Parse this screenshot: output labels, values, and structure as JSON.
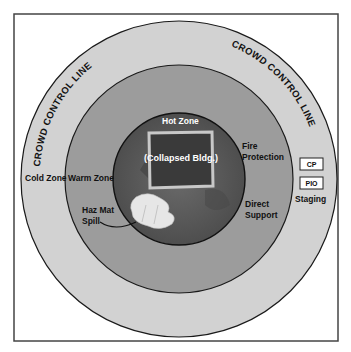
{
  "diagram": {
    "crowd_control_label_left": "CROWD CONTROL LINE",
    "crowd_control_label_right": "CROWD CONTROL LINE",
    "zones": {
      "cold": "Cold Zone",
      "warm": "Warm Zone",
      "hot": "Hot Zone"
    },
    "center_label": "(Collapsed Bldg.)",
    "fire_protection": [
      "Fire",
      "Protection"
    ],
    "direct_support": [
      "Direct",
      "Support"
    ],
    "haz_mat": [
      "Haz Mat",
      "Spill"
    ],
    "staging": {
      "boxes": [
        "CP",
        "PIO"
      ],
      "label": "Staging"
    },
    "colors": {
      "frame": "#444444",
      "cold_zone": "#d2d2d2",
      "warm_zone": "#9c9c9c",
      "hot_zone": "#5e5e5e",
      "building": "#3a3a3a",
      "building_border": "#c8c8c8",
      "spill": "#e6e6e6"
    }
  }
}
